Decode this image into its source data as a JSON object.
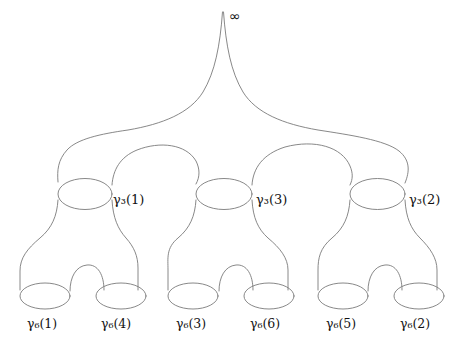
{
  "figure": {
    "kind": "pair-of-pants-decomposition",
    "stroke_color": "#7a7a7a",
    "background_color": "#ffffff",
    "text_color": "#111111",
    "width": 463,
    "height": 349
  },
  "cusp": {
    "symbol": "∞",
    "name": "infinity",
    "x": 233,
    "y": 17
  },
  "levels": [
    {
      "level": 3,
      "label_prefix": "γ",
      "subscript": "3",
      "curves": [
        {
          "index": "1",
          "label": "γ₃(1)",
          "x": 115,
          "y": 201
        },
        {
          "index": "3",
          "label": "γ₃(3)",
          "x": 257,
          "y": 201
        },
        {
          "index": "2",
          "label": "γ₃(2)",
          "x": 411,
          "y": 201
        }
      ]
    },
    {
      "level": 6,
      "label_prefix": "γ",
      "subscript": "6",
      "curves": [
        {
          "index": "1",
          "label": "γ₆(1)",
          "x": 52,
          "y": 325
        },
        {
          "index": "4",
          "label": "γ₆(4)",
          "x": 122,
          "y": 325
        },
        {
          "index": "3",
          "label": "γ₆(3)",
          "x": 201,
          "y": 325
        },
        {
          "index": "6",
          "label": "γ₆(6)",
          "x": 272,
          "y": 325
        },
        {
          "index": "5",
          "label": "γ₆(5)",
          "x": 350,
          "y": 325
        },
        {
          "index": "2",
          "label": "γ₆(2)",
          "x": 421,
          "y": 325
        }
      ]
    }
  ],
  "labels": {
    "cusp": "∞",
    "g3_1": "γ₃(1)",
    "g3_3": "γ₃(3)",
    "g3_2": "γ₃(2)",
    "g6_1": "γ₆(1)",
    "g6_4": "γ₆(4)",
    "g6_3": "γ₆(3)",
    "g6_6": "γ₆(6)",
    "g6_5": "γ₆(5)",
    "g6_2": "γ₆(2)"
  }
}
